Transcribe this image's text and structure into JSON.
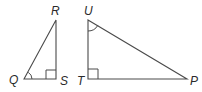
{
  "diagram": {
    "type": "geometry",
    "stroke_color": "#4a4a4a",
    "label_color": "#2a2a2a",
    "triangles": [
      {
        "name": "QRS",
        "vertices": {
          "Q": {
            "label": "Q",
            "x": 24,
            "y": 79
          },
          "R": {
            "label": "R",
            "x": 56,
            "y": 20
          },
          "S": {
            "label": "S",
            "x": 56,
            "y": 79
          }
        },
        "right_angle_at": "S",
        "marked_angle_at": "Q"
      },
      {
        "name": "UTP",
        "vertices": {
          "U": {
            "label": "U",
            "x": 88,
            "y": 20
          },
          "T": {
            "label": "T",
            "x": 88,
            "y": 79
          },
          "P": {
            "label": "P",
            "x": 187,
            "y": 79
          }
        },
        "right_angle_at": "T",
        "marked_angle_at": "U"
      }
    ],
    "labels": {
      "Q": "Q",
      "R": "R",
      "S": "S",
      "U": "U",
      "T": "T",
      "P": "P"
    }
  }
}
